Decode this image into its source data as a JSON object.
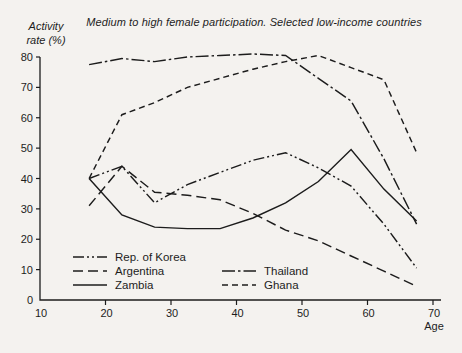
{
  "chart_data": {
    "type": "line",
    "title": "Medium to high female participation. Selected low-income countries",
    "ylabel_lines": [
      "Activity",
      "rate (%)"
    ],
    "xlabel": "Age",
    "x": [
      17.5,
      22.5,
      27.5,
      32.5,
      37.5,
      42.5,
      47.5,
      52.5,
      57.5,
      62.5,
      67.5
    ],
    "x_axis": {
      "ticks": [
        10,
        20,
        30,
        40,
        50,
        60,
        70
      ],
      "range": [
        10,
        71
      ]
    },
    "y_axis": {
      "ticks": [
        0,
        10,
        20,
        30,
        40,
        50,
        60,
        70,
        80
      ],
      "range": [
        0,
        80
      ],
      "grid": false
    },
    "line_color": "#1c1c1c",
    "series": [
      {
        "name": "Rep. of Korea",
        "line_style": "dash-dot-dot",
        "values": [
          40,
          44,
          32,
          38,
          42,
          46,
          48.5,
          43.5,
          37.5,
          25,
          10.5
        ]
      },
      {
        "name": "Argentina",
        "line_style": "long-dash",
        "values": [
          31,
          44,
          35.5,
          34.5,
          33,
          28.5,
          23,
          19.5,
          14.5,
          9.5,
          4.5
        ]
      },
      {
        "name": "Zambia",
        "line_style": "solid",
        "values": [
          40,
          28,
          24,
          23.5,
          23.5,
          27,
          32,
          39,
          49.5,
          36.5,
          26
        ]
      },
      {
        "name": "Thailand",
        "line_style": "dash-dot",
        "values": [
          77.5,
          79.5,
          78.5,
          80,
          80.5,
          81,
          80.5,
          73,
          65.5,
          46.5,
          25
        ]
      },
      {
        "name": "Ghana",
        "line_style": "short-dash",
        "values": [
          40,
          61,
          65,
          70,
          73,
          76,
          78.5,
          80.5,
          76.5,
          72.5,
          48.5
        ]
      }
    ],
    "legend": {
      "position": "bottom-inside",
      "columns": [
        [
          "Rep. of Korea",
          "Argentina",
          "Zambia"
        ],
        [
          "Thailand",
          "Ghana"
        ]
      ]
    }
  }
}
